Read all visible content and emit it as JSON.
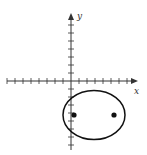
{
  "diagram": {
    "type": "ellipse-on-axes",
    "axes": {
      "x_label": "x",
      "y_label": "y",
      "x_range": [
        -8,
        8
      ],
      "y_range": [
        -8,
        8
      ],
      "tick_spacing": 1
    },
    "ellipse": {
      "center": [
        3,
        -4
      ],
      "semi_major_axis": 4,
      "semi_minor_axis": 3,
      "orientation": "horizontal"
    },
    "foci": [
      {
        "label": "focus-left",
        "point": [
          0.4,
          -4.25
        ]
      },
      {
        "label": "focus-right",
        "point": [
          5.4,
          -4.25
        ]
      }
    ],
    "colors": {
      "stroke": "#111111",
      "axis": "#333333",
      "background": "#ffffff"
    }
  }
}
